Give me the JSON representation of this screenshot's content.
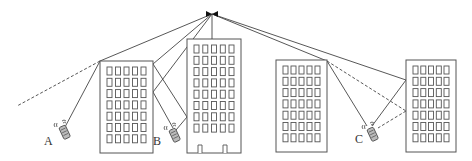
{
  "diagram": {
    "antenna": {
      "x": 212,
      "y": 14,
      "mast_to_y": 39,
      "icon": "base-station-antenna-icon"
    },
    "buildings": [
      {
        "id": "building-1",
        "x": 100,
        "y": 61,
        "w": 53,
        "h": 92,
        "rows": 7,
        "cols": 5,
        "doors": 0
      },
      {
        "id": "building-2",
        "x": 187,
        "y": 39,
        "w": 54,
        "h": 114,
        "rows": 8,
        "cols": 5,
        "doors": 2
      },
      {
        "id": "building-3",
        "x": 276,
        "y": 60,
        "w": 51,
        "h": 92,
        "rows": 7,
        "cols": 5,
        "doors": 0
      },
      {
        "id": "building-4",
        "x": 406,
        "y": 60,
        "w": 50,
        "h": 92,
        "rows": 7,
        "cols": 5,
        "doors": 0
      }
    ],
    "mobiles": [
      {
        "label": "A",
        "x": 63,
        "y": 130,
        "label_x": 44,
        "label_y": 144
      },
      {
        "label": "B",
        "x": 173,
        "y": 133,
        "label_x": 153,
        "label_y": 144
      },
      {
        "label": "C",
        "x": 371,
        "y": 132,
        "label_x": 355,
        "label_y": 142
      }
    ],
    "paths": [
      {
        "from": [
          212,
          14
        ],
        "to": [
          100,
          61
        ],
        "style": "solid"
      },
      {
        "from": [
          100,
          61
        ],
        "to": [
          17,
          106
        ],
        "style": "dashed"
      },
      {
        "from": [
          100,
          61
        ],
        "to": [
          65,
          127
        ],
        "style": "solid"
      },
      {
        "from": [
          212,
          14
        ],
        "to": [
          153,
          64
        ],
        "style": "solid"
      },
      {
        "from": [
          153,
          64
        ],
        "to": [
          187,
          117
        ],
        "style": "solid"
      },
      {
        "from": [
          187,
          117
        ],
        "to": [
          176,
          130
        ],
        "style": "solid"
      },
      {
        "from": [
          212,
          14
        ],
        "to": [
          153,
          92
        ],
        "style": "solid"
      },
      {
        "from": [
          153,
          92
        ],
        "to": [
          173,
          128
        ],
        "style": "solid"
      },
      {
        "from": [
          212,
          14
        ],
        "to": [
          327,
          61
        ],
        "style": "solid"
      },
      {
        "from": [
          327,
          61
        ],
        "to": [
          367,
          126
        ],
        "style": "solid"
      },
      {
        "from": [
          327,
          61
        ],
        "to": [
          406,
          111
        ],
        "style": "dashed"
      },
      {
        "from": [
          212,
          14
        ],
        "to": [
          406,
          80
        ],
        "style": "solid"
      },
      {
        "from": [
          406,
          80
        ],
        "to": [
          372,
          126
        ],
        "style": "solid"
      },
      {
        "from": [
          406,
          111
        ],
        "to": [
          378,
          128
        ],
        "style": "dashed"
      }
    ],
    "colors": {
      "line": "#444444",
      "outline": "#555555",
      "background": "#ffffff"
    }
  }
}
